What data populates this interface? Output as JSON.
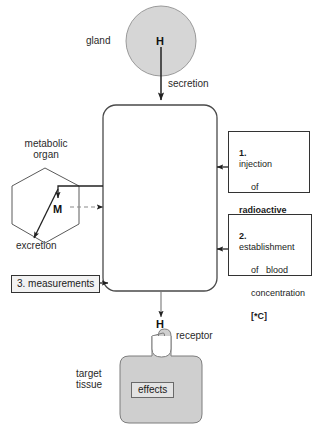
{
  "diagram": {
    "title_hidden": "",
    "gland": {
      "label": "gland",
      "hormone_symbol": "H",
      "fill": "#d6d6d6"
    },
    "secretion_label": "secretion",
    "blood_compartment": {
      "label": "",
      "fill": "#ffffff"
    },
    "metabolic_organ": {
      "label_line1": "metabolic",
      "label_line2": "organ",
      "metabolite_symbol": "M",
      "excretion_label": "excretion"
    },
    "steps": [
      {
        "number": "1.",
        "lines": [
          "injection",
          "of",
          "radioactive",
          "tracer   *H"
        ],
        "bold_lines": [
          false,
          false,
          true,
          true
        ]
      },
      {
        "number": "2.",
        "lines": [
          "establishment",
          "of   blood",
          "concentration",
          "[*C]"
        ],
        "bold_lines": [
          false,
          false,
          false,
          true
        ]
      },
      {
        "number": "3.",
        "lines": [
          "measurements"
        ],
        "bold_lines": [
          false
        ]
      }
    ],
    "step3_label": "3. measurements",
    "target": {
      "hormone_symbol": "H",
      "receptor_label": "receptor",
      "tissue_label_line1": "target",
      "tissue_label_line2": "tissue",
      "effects_label": "effects",
      "fill": "#cfcfcf"
    },
    "colors": {
      "ink": "#333333",
      "gland_fill": "#d6d6d6",
      "tissue_fill": "#cfcfcf",
      "effects_fill": "#e3e3e3",
      "measurements_fill": "#f2f2f2"
    }
  }
}
